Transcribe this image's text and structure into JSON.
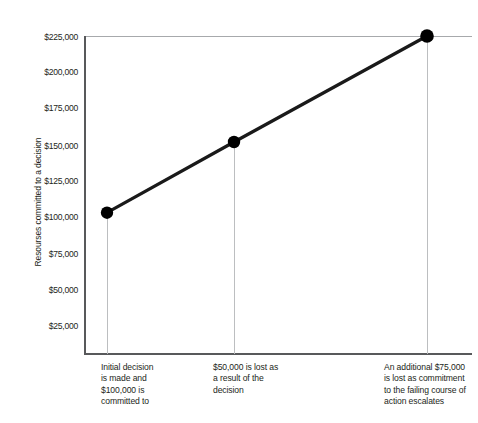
{
  "chart_data": {
    "type": "line",
    "title": "",
    "xlabel": "",
    "ylabel": "Resourses committed to a decision",
    "ylim": [
      0,
      225000
    ],
    "grid": false,
    "legend": null,
    "y_ticks": [
      "$225,000",
      "$200,000",
      "$175,000",
      "$150,000",
      "$125,000",
      "$100,000",
      "$75,000",
      "$50,000",
      "$25,000"
    ],
    "y_tick_values": [
      225000,
      200000,
      175000,
      150000,
      125000,
      100000,
      75000,
      50000,
      25000
    ],
    "categories": [
      "Initial decision",
      "Loss after decision",
      "Escalated commitment"
    ],
    "values": [
      100000,
      150000,
      225000
    ],
    "series": [
      {
        "name": "Resources committed",
        "values": [
          100000,
          150000,
          225000
        ]
      }
    ],
    "point_markers": true,
    "line_color": "#1a1a1a",
    "marker_color": "#000000",
    "dropline_color": "#bcbec0",
    "axis_color": "#58595b"
  },
  "axis": {
    "y_title": "Resourses committed to a decision",
    "ticks": [
      {
        "label": "$225,000",
        "value": 225000
      },
      {
        "label": "$200,000",
        "value": 200000
      },
      {
        "label": "$175,000",
        "value": 175000
      },
      {
        "label": "$150,000",
        "value": 150000
      },
      {
        "label": "$125,000",
        "value": 125000
      },
      {
        "label": "$100,000",
        "value": 100000
      },
      {
        "label": "$75,000",
        "value": 75000
      },
      {
        "label": "$50,000",
        "value": 50000
      },
      {
        "label": "$25,000",
        "value": 25000
      }
    ]
  },
  "captions": [
    {
      "lines": [
        "Initial decision",
        "is made and",
        "$100,000 is",
        "committed to"
      ]
    },
    {
      "lines": [
        "$50,000 is lost as",
        "a result of the",
        "decision"
      ]
    },
    {
      "lines": [
        "An additional $75,000",
        "is lost as commitment",
        "to the failing course of",
        "action escalates"
      ]
    }
  ]
}
